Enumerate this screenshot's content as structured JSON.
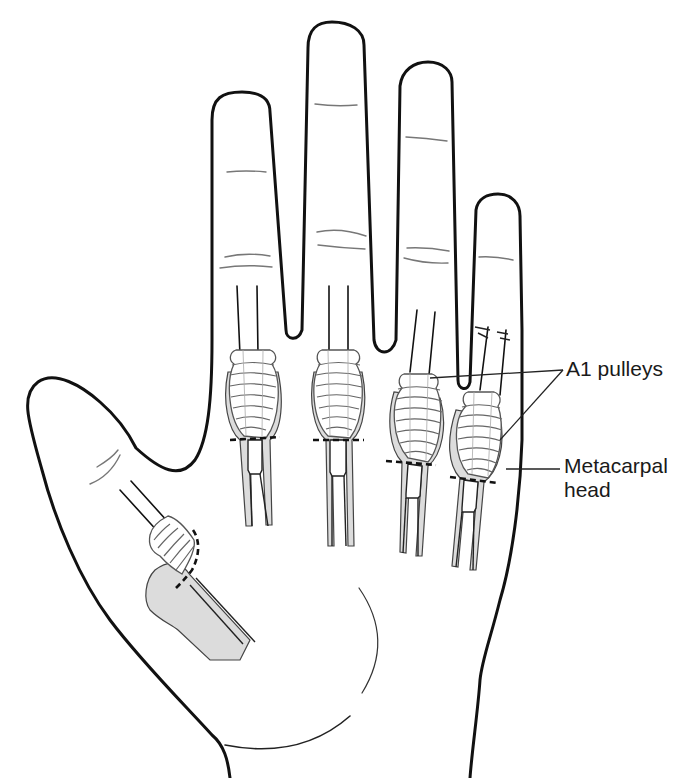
{
  "figure": {
    "labels": {
      "a1_pulleys": "A1 pulleys",
      "metacarpal_head_line1": "Metacarpal",
      "metacarpal_head_line2": "head"
    },
    "annotations": [
      {
        "name": "A1 pulleys",
        "leaders_to": [
          "ring-finger-pulley",
          "little-finger-pulley"
        ]
      },
      {
        "name": "Metacarpal head",
        "leaders_to": [
          "little-finger-metacarpal-head"
        ]
      }
    ],
    "structures": {
      "digits": [
        "thumb",
        "index",
        "middle",
        "ring",
        "little"
      ],
      "incision_lines": "dashed lines proximal to each A1 pulley",
      "shaded": "flexor tendon sheaths and thumb metacarpal"
    },
    "colors": {
      "outline": "#111111",
      "sheath_fill": "#dcdcdc",
      "crease": "#777777",
      "background": "#ffffff"
    }
  }
}
